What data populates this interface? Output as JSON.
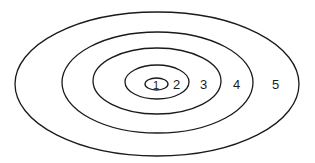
{
  "diagram": {
    "type": "concentric-ellipses",
    "stroke_color": "#1a1a1a",
    "background": "#ffffff",
    "rings": [
      {
        "id": 1,
        "label": "1"
      },
      {
        "id": 2,
        "label": "2"
      },
      {
        "id": 3,
        "label": "3"
      },
      {
        "id": 4,
        "label": "4"
      },
      {
        "id": 5,
        "label": "5"
      }
    ]
  }
}
